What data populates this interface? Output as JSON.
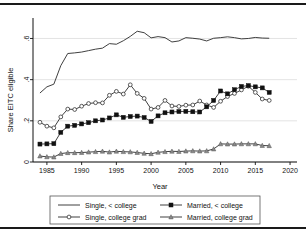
{
  "figure": {
    "has_top_rule": true,
    "has_bottom_rule": true
  },
  "chart_data": {
    "type": "line",
    "title": "",
    "xlabel": "Year",
    "ylabel": "Share EITC eligible",
    "xlim": [
      1983,
      2021
    ],
    "ylim": [
      0,
      0.68
    ],
    "xticks": [
      1985,
      1990,
      1995,
      2000,
      2005,
      2010,
      2015,
      2020
    ],
    "xticklabels": [
      "1985",
      "1990",
      "1995",
      "2000",
      "2005",
      "2010",
      "2015",
      "2020"
    ],
    "yticks": [
      0,
      0.2,
      0.4,
      0.6
    ],
    "yticklabels": [
      "0",
      ".2",
      ".4",
      ".6"
    ],
    "grid": true,
    "legend_position": "below",
    "x": [
      1984,
      1985,
      1986,
      1987,
      1988,
      1989,
      1990,
      1991,
      1992,
      1993,
      1994,
      1995,
      1996,
      1997,
      1998,
      1999,
      2000,
      2001,
      2002,
      2003,
      2004,
      2005,
      2006,
      2007,
      2008,
      2009,
      2010,
      2011,
      2012,
      2013,
      2014,
      2015,
      2016,
      2017
    ],
    "series": [
      {
        "name": "Single, < college",
        "marker": "none",
        "values": [
          0.335,
          0.365,
          0.378,
          0.468,
          0.527,
          0.53,
          0.534,
          0.541,
          0.548,
          0.553,
          0.575,
          0.572,
          0.589,
          0.61,
          0.635,
          0.628,
          0.603,
          0.609,
          0.604,
          0.583,
          0.588,
          0.604,
          0.601,
          0.597,
          0.588,
          0.601,
          0.604,
          0.608,
          0.604,
          0.598,
          0.6,
          0.605,
          0.602,
          0.601
        ]
      },
      {
        "name": "Single, college grad",
        "marker": "circle",
        "values": [
          0.193,
          0.174,
          0.166,
          0.219,
          0.257,
          0.255,
          0.271,
          0.284,
          0.288,
          0.287,
          0.324,
          0.343,
          0.33,
          0.375,
          0.333,
          0.309,
          0.257,
          0.265,
          0.299,
          0.272,
          0.27,
          0.276,
          0.277,
          0.296,
          0.277,
          0.265,
          0.295,
          0.318,
          0.333,
          0.35,
          0.368,
          0.338,
          0.306,
          0.299
        ]
      },
      {
        "name": "Married, < college",
        "marker": "square",
        "values": [
          0.087,
          0.088,
          0.089,
          0.144,
          0.174,
          0.178,
          0.185,
          0.191,
          0.2,
          0.204,
          0.214,
          0.229,
          0.217,
          0.221,
          0.223,
          0.216,
          0.197,
          0.224,
          0.239,
          0.243,
          0.245,
          0.246,
          0.244,
          0.243,
          0.268,
          0.299,
          0.345,
          0.331,
          0.351,
          0.367,
          0.371,
          0.365,
          0.36,
          0.338
        ]
      },
      {
        "name": "Married, college grad",
        "marker": "triangle",
        "values": [
          0.029,
          0.025,
          0.024,
          0.041,
          0.045,
          0.045,
          0.046,
          0.048,
          0.05,
          0.052,
          0.048,
          0.052,
          0.05,
          0.049,
          0.046,
          0.042,
          0.04,
          0.047,
          0.05,
          0.052,
          0.051,
          0.053,
          0.054,
          0.053,
          0.054,
          0.063,
          0.088,
          0.087,
          0.087,
          0.088,
          0.088,
          0.088,
          0.08,
          0.079
        ]
      }
    ],
    "legend": [
      {
        "label": "Single, < college",
        "marker": "none"
      },
      {
        "label": "Married, < college",
        "marker": "square"
      },
      {
        "label": "Single, college grad",
        "marker": "circle"
      },
      {
        "label": "Married, college grad",
        "marker": "triangle"
      }
    ]
  }
}
